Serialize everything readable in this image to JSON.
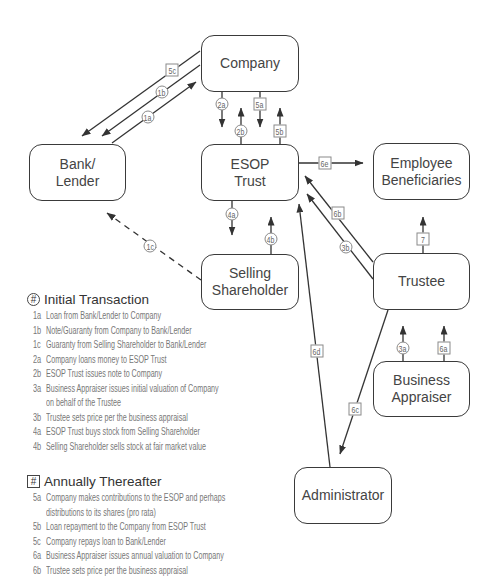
{
  "diagram": {
    "nodes": {
      "company": [
        "Company"
      ],
      "bank": [
        "Bank/",
        "Lender"
      ],
      "esop": [
        "ESOP",
        "Trust"
      ],
      "employees": [
        "Employee",
        "Beneficiaries"
      ],
      "selling": [
        "Selling",
        "Shareholder"
      ],
      "trustee": [
        "Trustee"
      ],
      "appraiser": [
        "Business",
        "Appraiser"
      ],
      "administrator": [
        "Administrator"
      ]
    },
    "edges": [
      {
        "label": "5c",
        "shape": "square",
        "from": "Company",
        "to": "Bank/Lender"
      },
      {
        "label": "1b",
        "shape": "circle",
        "from": "Company",
        "to": "Bank/Lender"
      },
      {
        "label": "1a",
        "shape": "circle",
        "from": "Bank/Lender",
        "to": "Company"
      },
      {
        "label": "2a",
        "shape": "circle",
        "from": "Company",
        "to": "ESOP Trust"
      },
      {
        "label": "5a",
        "shape": "square",
        "from": "Company",
        "to": "ESOP Trust"
      },
      {
        "label": "2b",
        "shape": "circle",
        "from": "ESOP Trust",
        "to": "Company"
      },
      {
        "label": "5b",
        "shape": "square",
        "from": "ESOP Trust",
        "to": "Company"
      },
      {
        "label": "6e",
        "shape": "square",
        "from": "ESOP Trust",
        "to": "Employee Beneficiaries"
      },
      {
        "label": "4a",
        "shape": "circle",
        "from": "ESOP Trust",
        "to": "Selling Shareholder"
      },
      {
        "label": "4b",
        "shape": "circle",
        "from": "Selling Shareholder",
        "to": "ESOP Trust"
      },
      {
        "label": "1c",
        "shape": "circle",
        "from": "Selling Shareholder",
        "to": "Bank/Lender",
        "style": "dashed"
      },
      {
        "label": "6b",
        "shape": "square",
        "from": "Trustee",
        "to": "ESOP Trust"
      },
      {
        "label": "3b",
        "shape": "circle",
        "from": "Trustee",
        "to": "ESOP Trust"
      },
      {
        "label": "7",
        "shape": "square",
        "from": "Trustee",
        "to": "Employee Beneficiaries"
      },
      {
        "label": "6d",
        "shape": "square",
        "from": "Administrator",
        "to": "ESOP Trust"
      },
      {
        "label": "6c",
        "shape": "square",
        "from": "Trustee",
        "to": "Administrator"
      },
      {
        "label": "3a",
        "shape": "circle",
        "from": "Business Appraiser",
        "to": "Trustee"
      },
      {
        "label": "6a",
        "shape": "square",
        "from": "Business Appraiser",
        "to": "Trustee"
      }
    ]
  },
  "legend": {
    "initial": {
      "marker": "#",
      "marker_shape": "circle",
      "title": "Initial Transaction",
      "items": [
        {
          "code": "1a",
          "lines": [
            "Loan from Bank/Lender to Company"
          ]
        },
        {
          "code": "1b",
          "lines": [
            "Note/Guaranty from Company to Bank/Lender"
          ]
        },
        {
          "code": "1c",
          "lines": [
            "Guaranty from Selling Shareholder to Bank/Lender"
          ]
        },
        {
          "code": "2a",
          "lines": [
            "Company loans money to ESOP Trust"
          ]
        },
        {
          "code": "2b",
          "lines": [
            "ESOP Trust issues note to Company"
          ]
        },
        {
          "code": "3a",
          "lines": [
            "Business Appraiser issues initial valuation of Company",
            "on behalf of the Trustee"
          ]
        },
        {
          "code": "3b",
          "lines": [
            "Trustee sets price per the business appraisal"
          ]
        },
        {
          "code": "4a",
          "lines": [
            "ESOP Trust buys stock from Selling Shareholder"
          ]
        },
        {
          "code": "4b",
          "lines": [
            "Selling Shareholder sells stock at fair market value"
          ]
        }
      ]
    },
    "annual": {
      "marker": "#",
      "marker_shape": "square",
      "title": "Annually Thereafter",
      "items": [
        {
          "code": "5a",
          "lines": [
            "Company makes contributions to the ESOP and perhaps",
            "distributions to its shares (pro rata)"
          ]
        },
        {
          "code": "5b",
          "lines": [
            "Loan repayment to the Company from ESOP Trust"
          ]
        },
        {
          "code": "5c",
          "lines": [
            "Company repays loan to Bank/Lender"
          ]
        },
        {
          "code": "6a",
          "lines": [
            "Business Appraiser issues annual valuation to Company"
          ]
        },
        {
          "code": "6b",
          "lines": [
            "Trustee sets price per the business appraisal"
          ]
        }
      ]
    }
  },
  "colors": {
    "line": "#333333",
    "box_border": "#3a3a3a",
    "label_border": "#8a8a8a",
    "legend_text": "#777777"
  }
}
